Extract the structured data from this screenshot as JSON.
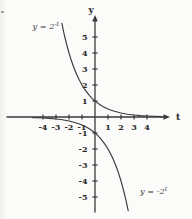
{
  "figure": {
    "background": "#fbfbfa",
    "ink": "#3a3a3a",
    "number_color": "#262626"
  },
  "chart_data": {
    "type": "line",
    "title": "",
    "xlabel": "t",
    "ylabel": "y",
    "xlim": [
      -4.9,
      5.6
    ],
    "ylim": [
      -6.3,
      6.3
    ],
    "grid": false,
    "x_ticks": [
      -4,
      -3,
      -2,
      -1,
      1,
      2,
      3,
      4
    ],
    "y_ticks": [
      5,
      4,
      3,
      2,
      1,
      -1,
      -2,
      -3,
      -4,
      -5
    ],
    "series": [
      {
        "id": "y-eq-2-pow-neg-t",
        "name": "y = 2^(-t)",
        "label_base": "y = 2",
        "label_exp": "-t",
        "y_intercept": 1,
        "points": [
          [
            -2.55,
            5.856
          ],
          [
            -2.4,
            5.278
          ],
          [
            -2.2,
            4.595
          ],
          [
            -2.0,
            4.0
          ],
          [
            -1.8,
            3.482
          ],
          [
            -1.6,
            3.031
          ],
          [
            -1.4,
            2.639
          ],
          [
            -1.2,
            2.297
          ],
          [
            -1.0,
            2.0
          ],
          [
            -0.8,
            1.741
          ],
          [
            -0.6,
            1.516
          ],
          [
            -0.4,
            1.32
          ],
          [
            -0.2,
            1.149
          ],
          [
            0,
            1.0
          ],
          [
            0.25,
            0.841
          ],
          [
            0.5,
            0.707
          ],
          [
            0.75,
            0.595
          ],
          [
            1,
            0.5
          ],
          [
            1.25,
            0.42
          ],
          [
            1.5,
            0.354
          ],
          [
            2,
            0.25
          ],
          [
            2.5,
            0.177
          ],
          [
            3,
            0.125
          ],
          [
            3.5,
            0.088
          ],
          [
            4,
            0.0625
          ],
          [
            4.5,
            0.044
          ],
          [
            5.2,
            0.027
          ]
        ]
      },
      {
        "id": "y-eq-neg-2-pow-t",
        "name": "y = -2^t",
        "label_base": "y = -2",
        "label_exp": "t",
        "y_intercept": -1,
        "points": [
          [
            -4.8,
            -0.036
          ],
          [
            -4.5,
            -0.044
          ],
          [
            -4,
            -0.0625
          ],
          [
            -3.5,
            -0.088
          ],
          [
            -3,
            -0.125
          ],
          [
            -2.5,
            -0.177
          ],
          [
            -2,
            -0.25
          ],
          [
            -1.5,
            -0.354
          ],
          [
            -1.25,
            -0.42
          ],
          [
            -1,
            -0.5
          ],
          [
            -0.75,
            -0.595
          ],
          [
            -0.5,
            -0.707
          ],
          [
            -0.25,
            -0.841
          ],
          [
            0,
            -1.0
          ],
          [
            0.2,
            -1.149
          ],
          [
            0.4,
            -1.32
          ],
          [
            0.6,
            -1.516
          ],
          [
            0.8,
            -1.741
          ],
          [
            1.0,
            -2.0
          ],
          [
            1.2,
            -2.297
          ],
          [
            1.4,
            -2.639
          ],
          [
            1.6,
            -3.031
          ],
          [
            1.8,
            -3.482
          ],
          [
            2.0,
            -4.0
          ],
          [
            2.2,
            -4.595
          ],
          [
            2.4,
            -5.278
          ],
          [
            2.55,
            -5.856
          ]
        ]
      }
    ]
  }
}
